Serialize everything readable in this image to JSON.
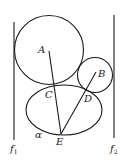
{
  "diagram": {
    "type": "geometry",
    "lines": {
      "f1": {
        "label": "f",
        "subscript": "1"
      },
      "f2": {
        "label": "f",
        "subscript": "2"
      }
    },
    "circles": [
      {
        "center_label": "A"
      },
      {
        "center_label": "B"
      }
    ],
    "ellipse": {
      "label": "α"
    },
    "points": {
      "A": "A",
      "B": "B",
      "C": "C",
      "D": "D",
      "E": "E"
    },
    "segments": [
      "AE",
      "BE"
    ]
  }
}
